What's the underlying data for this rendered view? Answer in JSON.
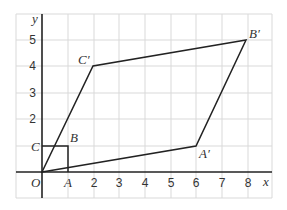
{
  "axes": {
    "x_label": "x",
    "y_label": "y",
    "origin_label": "O",
    "x_ticks": [
      "2",
      "3",
      "4",
      "5",
      "6",
      "7",
      "8"
    ],
    "y_ticks": [
      "2",
      "3",
      "4",
      "5"
    ]
  },
  "grid": {
    "x_range": [
      -1,
      8.6
    ],
    "y_range": [
      -1,
      6
    ],
    "spacing": 1
  },
  "shapes": {
    "square": {
      "vertices": [
        [
          "O",
          0,
          0
        ],
        [
          "A",
          1,
          0
        ],
        [
          "B",
          1,
          1
        ],
        [
          "C",
          0,
          1
        ]
      ],
      "labels": {
        "A": "A",
        "B": "B",
        "C": "C"
      }
    },
    "image": {
      "vertices": [
        [
          "O",
          0,
          0
        ],
        [
          "A'",
          6,
          1
        ],
        [
          "B'",
          8,
          5
        ],
        [
          "C'",
          2,
          4
        ]
      ],
      "labels": {
        "A": "A′",
        "B": "B′",
        "C": "C′"
      }
    }
  },
  "colors": {
    "grid": "#d9d9d9",
    "lines": "#222222",
    "text": "#333333"
  }
}
